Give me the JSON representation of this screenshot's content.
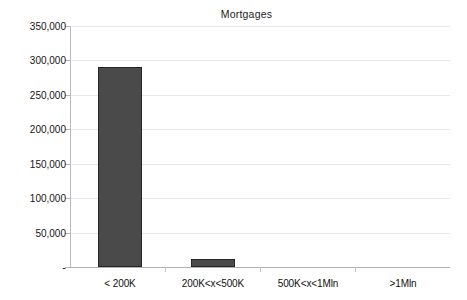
{
  "chart_data": {
    "type": "bar",
    "title": "Mortgages",
    "xlabel": "",
    "ylabel": "",
    "categories": [
      "< 200K",
      "200K<x<500K",
      "500K<x<1Mln",
      ">1Mln"
    ],
    "values": [
      290000,
      12000,
      0,
      0
    ],
    "ylim": [
      0,
      350000
    ],
    "ytick_values": [
      0,
      50000,
      100000,
      150000,
      200000,
      250000,
      300000,
      350000
    ],
    "ytick_labels": [
      "-",
      "50,000",
      "100,000",
      "150,000",
      "200,000",
      "250,000",
      "300,000",
      "350,000"
    ],
    "grid": true,
    "legend": false,
    "legend_position": "none",
    "series": [
      {
        "name": "Mortgages",
        "values": [
          290000,
          12000,
          0,
          0
        ],
        "color": "#4a4a4a"
      }
    ]
  },
  "colors": {
    "bar_fill": "#4a4a4a",
    "bar_border": "#262626",
    "gridline": "#e8e8e8",
    "axis": "#b9b9b9",
    "background": "#ffffff",
    "text": "#151515"
  }
}
